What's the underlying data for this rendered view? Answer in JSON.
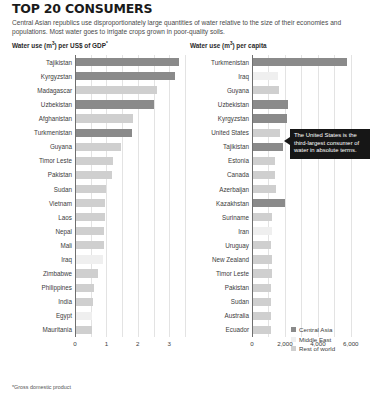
{
  "header": {
    "title": "TOP 20 CONSUMERS",
    "subtitle": "Central Asian republics use disproportionately large quantities of water relative to the size of their economies and populations. Most water goes to irrigate crops grown in poor-quality soils."
  },
  "footnote": "*Gross domestic product",
  "annotation": {
    "text": "The United States is the third-largest consumer of water in absolute terms."
  },
  "legend": {
    "position": "bottom-right",
    "items": [
      {
        "label": "Central Asia",
        "color": "#8a8a8a",
        "key": "central"
      },
      {
        "label": "Middle East",
        "color": "#efefef",
        "key": "middle"
      },
      {
        "label": "Rest of world",
        "color": "#cfcfcf",
        "key": "rest"
      }
    ]
  },
  "chart_data": [
    {
      "id": "gdp",
      "type": "bar",
      "orientation": "horizontal",
      "title": "Water use (m³) per US$ of GDP*",
      "title_main": "Water use (m",
      "title_sup": "3",
      "title_tail": ") per US$ of GDP",
      "title_footnote_mark": "*",
      "xlabel": "",
      "ylabel": "",
      "xlim": [
        0,
        3.5
      ],
      "ticks": [
        0,
        1,
        2,
        3
      ],
      "tick_labels": [
        "0",
        "1",
        "2",
        "3"
      ],
      "gridlines": [
        0,
        0.5,
        1,
        1.5,
        2,
        2.5,
        3,
        3.5
      ],
      "grid": true,
      "categories": [
        "Tajikistan",
        "Kyrgyzstan",
        "Madagascar",
        "Uzbekistan",
        "Afghanistan",
        "Turkmenistan",
        "Guyana",
        "Timor Leste",
        "Pakistan",
        "Sudan",
        "Vietnam",
        "Laos",
        "Nepal",
        "Mali",
        "Iraq",
        "Zimbabwe",
        "Philippines",
        "India",
        "Egypt",
        "Mauritania"
      ],
      "values": [
        3.3,
        3.18,
        2.62,
        2.52,
        1.84,
        1.8,
        1.46,
        1.22,
        1.19,
        0.98,
        0.97,
        0.95,
        0.93,
        0.92,
        0.88,
        0.72,
        0.62,
        0.58,
        0.55,
        0.53
      ],
      "groups": [
        "central",
        "central",
        "rest",
        "central",
        "rest",
        "central",
        "rest",
        "rest",
        "rest",
        "rest",
        "rest",
        "rest",
        "rest",
        "rest",
        "middle",
        "rest",
        "rest",
        "rest",
        "middle",
        "rest"
      ]
    },
    {
      "id": "capita",
      "type": "bar",
      "orientation": "horizontal",
      "title": "Water use (m³) per capita",
      "title_main": "Water use (m",
      "title_sup": "3",
      "title_tail": ") per capita",
      "title_footnote_mark": "",
      "xlabel": "",
      "ylabel": "",
      "xlim": [
        0,
        6800
      ],
      "ticks": [
        0,
        2000,
        4000,
        6000
      ],
      "tick_labels": [
        "0",
        "2,000",
        "4,000",
        "6,000"
      ],
      "gridlines": [
        0,
        1000,
        2000,
        3000,
        4000,
        5000,
        6000
      ],
      "grid": true,
      "categories": [
        "Turkmenistan",
        "Iraq",
        "Guyana",
        "Uzbekistan",
        "Kyrgyzstan",
        "United States",
        "Tajikistan",
        "Estonia",
        "Canada",
        "Azerbaijan",
        "Kazakhstan",
        "Suriname",
        "Iran",
        "Uruguay",
        "New Zealand",
        "Timor Leste",
        "Pakistan",
        "Sudan",
        "Australia",
        "Ecuador"
      ],
      "values": [
        5750,
        1600,
        1640,
        2180,
        2140,
        1730,
        1880,
        1400,
        1420,
        1460,
        2000,
        1240,
        1200,
        1180,
        1230,
        1190,
        1170,
        1160,
        1150,
        1140
      ],
      "groups": [
        "central",
        "middle",
        "rest",
        "central",
        "central",
        "rest",
        "central",
        "rest",
        "rest",
        "rest",
        "central",
        "rest",
        "middle",
        "rest",
        "rest",
        "rest",
        "rest",
        "rest",
        "rest",
        "rest"
      ]
    }
  ]
}
